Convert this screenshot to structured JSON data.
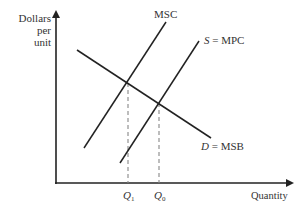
{
  "diagram": {
    "title": "",
    "y_axis_label": [
      "Dollars",
      "per",
      "unit"
    ],
    "x_axis_label": "Quantity",
    "curves": [
      {
        "id": "msc",
        "label": "MSC",
        "italic_prefix": "",
        "x1": 84,
        "y1": 148,
        "x2": 166,
        "y2": 22
      },
      {
        "id": "mpc",
        "label": " = MPC",
        "italic_prefix": "S",
        "x1": 120,
        "y1": 163,
        "x2": 199,
        "y2": 41
      },
      {
        "id": "msb",
        "label": " = MSB",
        "italic_prefix": "D",
        "x1": 77,
        "y1": 50,
        "x2": 211,
        "y2": 138
      }
    ],
    "quantities": [
      {
        "id": "q1",
        "symbol": "Q",
        "subscript": "1",
        "x": 128,
        "y_top": 83
      },
      {
        "id": "q0",
        "symbol": "Q",
        "subscript": "0",
        "x": 159,
        "y_top": 103
      }
    ],
    "colors": {
      "line": "#222222",
      "dashed": "#888888",
      "text": "#333333"
    }
  }
}
